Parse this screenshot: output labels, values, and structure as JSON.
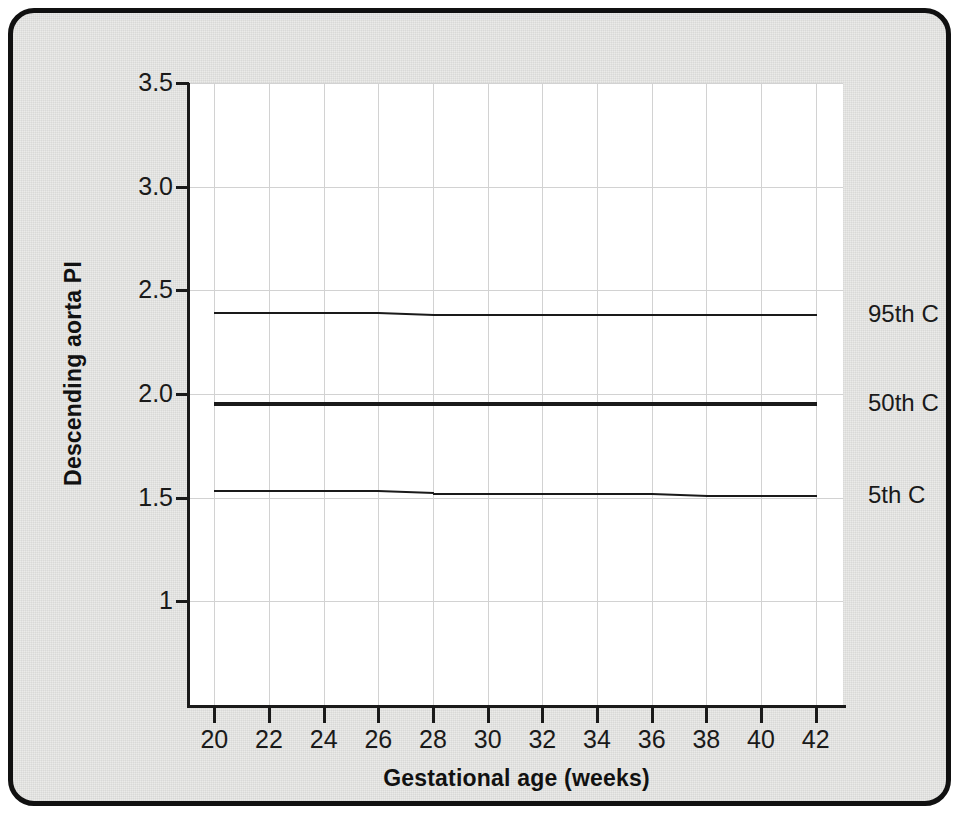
{
  "figure": {
    "frame_border_color": "#111111",
    "background_color": "#e9e9e7",
    "plot_background_color": "#ffffff",
    "gridline_color": "#d2d2d2",
    "line_color": "#1a1a1a"
  },
  "chart_data": {
    "type": "line",
    "title": "",
    "xlabel": "Gestational age (weeks)",
    "ylabel": "Descending aorta PI",
    "xlim": [
      19,
      43
    ],
    "ylim": [
      0.5,
      3.5
    ],
    "grid": true,
    "legend_position": "right-of-plot",
    "x_ticks": [
      20,
      22,
      24,
      26,
      28,
      30,
      32,
      34,
      36,
      38,
      40,
      42
    ],
    "x_tick_labels": [
      "20",
      "22",
      "24",
      "26",
      "28",
      "30",
      "32",
      "34",
      "36",
      "38",
      "40",
      "42"
    ],
    "y_ticks": [
      1.0,
      1.5,
      2.0,
      2.5,
      3.0,
      3.5
    ],
    "y_tick_labels": [
      "1",
      "1.5",
      "2.0",
      "2.5",
      "3.0",
      "3.5"
    ],
    "x": [
      20,
      22,
      24,
      26,
      28,
      30,
      32,
      34,
      36,
      38,
      40,
      42
    ],
    "series": [
      {
        "name": "95th C",
        "label": "95th C",
        "line_width": 2,
        "values": [
          2.39,
          2.39,
          2.39,
          2.39,
          2.38,
          2.38,
          2.38,
          2.38,
          2.38,
          2.38,
          2.38,
          2.38
        ]
      },
      {
        "name": "50th C",
        "label": "50th C",
        "line_width": 4,
        "values": [
          1.95,
          1.95,
          1.95,
          1.95,
          1.95,
          1.95,
          1.95,
          1.95,
          1.95,
          1.95,
          1.95,
          1.95
        ]
      },
      {
        "name": "5th C",
        "label": "5th C",
        "line_width": 2,
        "values": [
          1.53,
          1.53,
          1.53,
          1.53,
          1.52,
          1.52,
          1.52,
          1.52,
          1.52,
          1.51,
          1.51,
          1.51
        ]
      }
    ]
  }
}
